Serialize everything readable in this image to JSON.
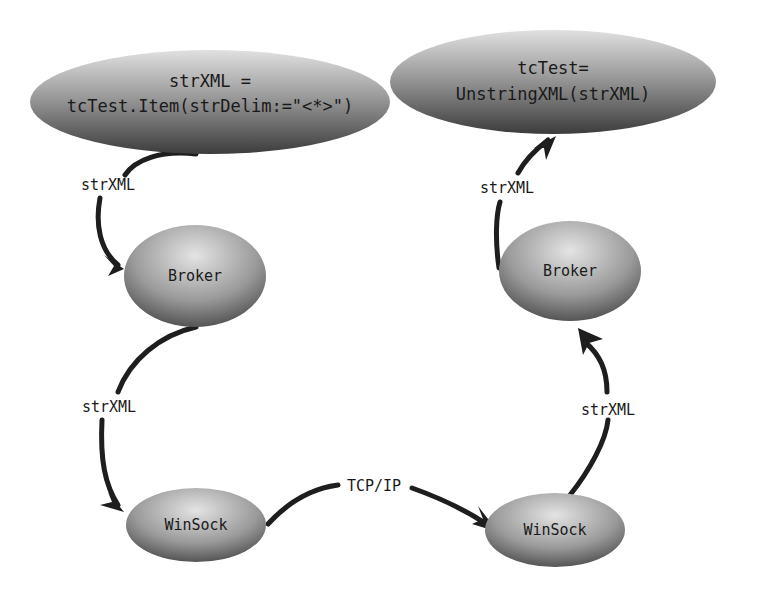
{
  "nodes": {
    "source": {
      "line1": "strXML =",
      "line2": "tcTest.Item(strDelim:=\"<*>\")"
    },
    "target": {
      "line1": "tcTest=",
      "line2": "UnstringXML(strXML)"
    },
    "broker_left": {
      "label": "Broker"
    },
    "broker_right": {
      "label": "Broker"
    },
    "winsock_left": {
      "label": "WinSock"
    },
    "winsock_right": {
      "label": "WinSock"
    }
  },
  "edges": {
    "source_to_broker": "strXML",
    "broker_to_winsock_left": "strXML",
    "winsock_to_winsock": "TCP/IP",
    "winsock_to_broker_right": "strXML",
    "broker_to_target": "strXML"
  },
  "colors": {
    "node_light": "#d8d8d8",
    "node_dark": "#4a4a4a",
    "edge": "#1e1e1e"
  }
}
